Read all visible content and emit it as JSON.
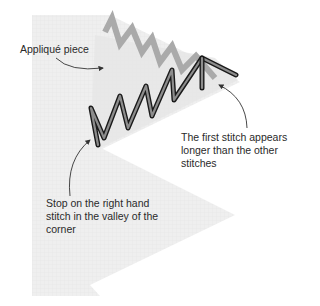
{
  "diagram": {
    "colors": {
      "background": "#ffffff",
      "fabric": "#ececec",
      "fabric_grid": "#e2e2e2",
      "seam_band": "#e4e4e4",
      "back_stitch": "#aaaaaa",
      "front_stitch_fill": "#8c8c8c",
      "front_stitch_outline": "#1a1a1a",
      "text": "#2a2a2a",
      "leader_line": "#333333"
    },
    "labels": {
      "applique": "Appliqué piece",
      "first_stitch": [
        "The first stitch appears",
        "longer than the other",
        "stitches"
      ],
      "stop": [
        "Stop on the right hand",
        "stitch in the valley of the",
        "corner"
      ]
    }
  }
}
